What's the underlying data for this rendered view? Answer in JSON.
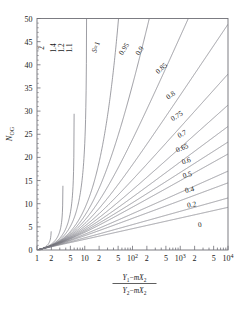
{
  "chart_data": {
    "type": "line",
    "title": "",
    "xlabel": "(Y1 - mX2) / (Y2 - mX2)",
    "ylabel": "N_OG",
    "xscale": "log",
    "xlim": [
      1,
      10000
    ],
    "ylim": [
      0,
      50
    ],
    "grid": false,
    "legend": "inline-curve-labels",
    "xticks": [
      1,
      2,
      5,
      10,
      20,
      50,
      100,
      200,
      500,
      1000,
      2000,
      5000,
      10000
    ],
    "xticklabels": [
      "1",
      "2",
      "5",
      "10",
      "2",
      "5",
      "10²",
      "2",
      "5",
      "10³",
      "2",
      "5",
      "10⁴"
    ],
    "yticks": [
      0,
      5,
      10,
      15,
      20,
      25,
      30,
      35,
      40,
      45,
      50
    ],
    "yticklabels": [
      "0",
      "5",
      "10",
      "15",
      "20",
      "25",
      "30",
      "35",
      "40",
      "45",
      "50"
    ],
    "parameter_symbol": "S",
    "formula": "N_OG = ln[(1-S)*R + S] / (1-S)",
    "series": [
      {
        "name": "2",
        "S": 2.0,
        "label": "2"
      },
      {
        "name": "1.4",
        "S": 1.4,
        "label": "1.4"
      },
      {
        "name": "1.2",
        "S": 1.2,
        "label": "1.2"
      },
      {
        "name": "1.1",
        "S": 1.1,
        "label": "1.1"
      },
      {
        "name": "S=1",
        "S": 1.0,
        "label": "S=1"
      },
      {
        "name": "0.95",
        "S": 0.95,
        "label": "0.95"
      },
      {
        "name": "0.9",
        "S": 0.9,
        "label": "0.9"
      },
      {
        "name": "0.85",
        "S": 0.85,
        "label": "0.85"
      },
      {
        "name": "0.8",
        "S": 0.8,
        "label": "0.8"
      },
      {
        "name": "0.75",
        "S": 0.75,
        "label": "0.75"
      },
      {
        "name": "0.7",
        "S": 0.7,
        "label": "0.7"
      },
      {
        "name": "0.65",
        "S": 0.65,
        "label": "0.65"
      },
      {
        "name": "0.6",
        "S": 0.6,
        "label": "0.6"
      },
      {
        "name": "0.5",
        "S": 0.5,
        "label": "0.5"
      },
      {
        "name": "0.4",
        "S": 0.4,
        "label": "0.4"
      },
      {
        "name": "0.2",
        "S": 0.2,
        "label": "0.2"
      },
      {
        "name": "0",
        "S": 0.0,
        "label": "0"
      }
    ]
  },
  "axes": {
    "y_label_text": "N",
    "y_label_sub": "OG",
    "x_label_numerator": "Y₁−mX₂",
    "x_label_denominator": "Y₂−mX₂"
  },
  "style": {
    "curve_color": "#7d7d85",
    "axis_color": "#6f6f76",
    "text_color": "#1a1a1a",
    "background": "#ffffff"
  }
}
